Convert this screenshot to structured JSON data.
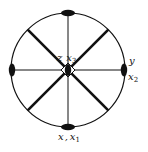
{
  "diagram": {
    "type": "symmetry-stereogram",
    "circle": {
      "cx": 68,
      "cy": 70,
      "r": 57,
      "stroke": "#111111"
    },
    "labels": {
      "center": {
        "axis1": "z",
        "axis2": "x",
        "axis2_sub": "3"
      },
      "right": {
        "axis1": "y",
        "axis2": "x",
        "axis2_sub": "2"
      },
      "bottom": {
        "axis1": "x",
        "axis2": "x",
        "axis2_sub": "1"
      }
    },
    "mirror_lines": {
      "thin": [
        "vertical",
        "horizontal"
      ],
      "thick": [
        "diagonal-45",
        "diagonal-135"
      ]
    },
    "two_fold_axes": [
      "top",
      "bottom",
      "left",
      "right"
    ],
    "four_fold_axis": "center"
  }
}
